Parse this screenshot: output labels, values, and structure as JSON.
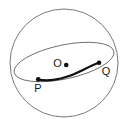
{
  "figure": {
    "kind": "geometry-diagram",
    "width": 127,
    "height": 129,
    "background_color": "#ffffff"
  },
  "colors": {
    "background": "#ffffff",
    "sphere_outline": "#6b6b6b",
    "great_circle_outline": "#6b6b6b",
    "highlight_arc": "#111111",
    "point_fill": "#111111",
    "label_text": "#1a1a1a"
  },
  "sphere": {
    "label": "sphere-outline",
    "center_x": 64,
    "center_y": 63,
    "radius": 54,
    "stroke_width": 0.9
  },
  "great_circle": {
    "label": "great-circle-ellipse",
    "center_x": 64,
    "center_y": 62,
    "semi_major": 51,
    "semi_minor": 17,
    "rotation_deg": -12,
    "stroke_width": 0.9
  },
  "highlight_arc": {
    "label": "arc-P-to-Q",
    "stroke_width": 2.1,
    "path": "M 38 79.5 C 52 82.5 70 77 83 70 C 90 66.4 95 64 99 62.8"
  },
  "points": [
    {
      "id": "O",
      "name": "center-point",
      "label": "O",
      "cx": 66.2,
      "cy": 65.0,
      "r": 2.3,
      "label_x": 57.5,
      "label_y": 66.5,
      "label_anchor": "middle"
    },
    {
      "id": "P",
      "name": "point-p",
      "label": "P",
      "cx": 38.2,
      "cy": 79.4,
      "r": 2.3,
      "label_x": 38.0,
      "label_y": 91.5,
      "label_anchor": "middle"
    },
    {
      "id": "Q",
      "name": "point-q",
      "label": "Q",
      "cx": 99.0,
      "cy": 62.8,
      "r": 2.3,
      "label_x": 106.0,
      "label_y": 75.0,
      "label_anchor": "middle"
    }
  ]
}
